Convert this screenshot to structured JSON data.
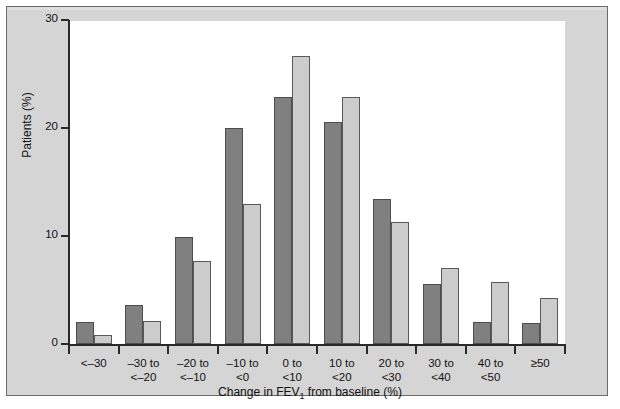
{
  "chart_data": {
    "type": "bar",
    "title": "",
    "xlabel": "Change in FEV1 from baseline (%)",
    "xlabel_prefix": "Change in FEV",
    "xlabel_subscript": "1",
    "xlabel_suffix": " from baseline (%)",
    "ylabel": "Patients (%)",
    "ylim": [
      0,
      30
    ],
    "yticks": [
      0,
      10,
      20,
      30
    ],
    "ytick_labels": [
      "0",
      "10",
      "20",
      "30"
    ],
    "grid": false,
    "legend": "none",
    "categories": [
      "<–30",
      "–30 to\n<–20",
      "–20 to\n<–10",
      "–10 to\n<0",
      "0 to\n<10",
      "10 to\n<20",
      "20 to\n<30",
      "30 to\n<40",
      "40 to\n<50",
      "≥50"
    ],
    "category_lines": [
      [
        "<–30",
        ""
      ],
      [
        "–30 to",
        "<–20"
      ],
      [
        "–20 to",
        "<–10"
      ],
      [
        "–10 to",
        "<0"
      ],
      [
        "0 to",
        "<10"
      ],
      [
        "10 to",
        "<20"
      ],
      [
        "20 to",
        "<30"
      ],
      [
        "30 to",
        "<40"
      ],
      [
        "40 to",
        "<50"
      ],
      [
        "≥50",
        ""
      ]
    ],
    "series": [
      {
        "name": "dark",
        "color": "#808080",
        "values": [
          2.0,
          3.6,
          9.9,
          20.0,
          22.9,
          20.6,
          13.4,
          5.6,
          2.0,
          1.9
        ]
      },
      {
        "name": "light",
        "color": "#cccccc",
        "values": [
          0.8,
          2.1,
          7.7,
          13.0,
          26.7,
          22.9,
          11.3,
          7.0,
          5.7,
          4.3
        ]
      }
    ]
  },
  "colors": {
    "panel_background": "#d5d5d5",
    "plot_background": "#ffffff",
    "axis": "#2a2a2a",
    "series_dark": "#808080",
    "series_light": "#cccccc",
    "bar_outline": "#4a4a4a"
  }
}
